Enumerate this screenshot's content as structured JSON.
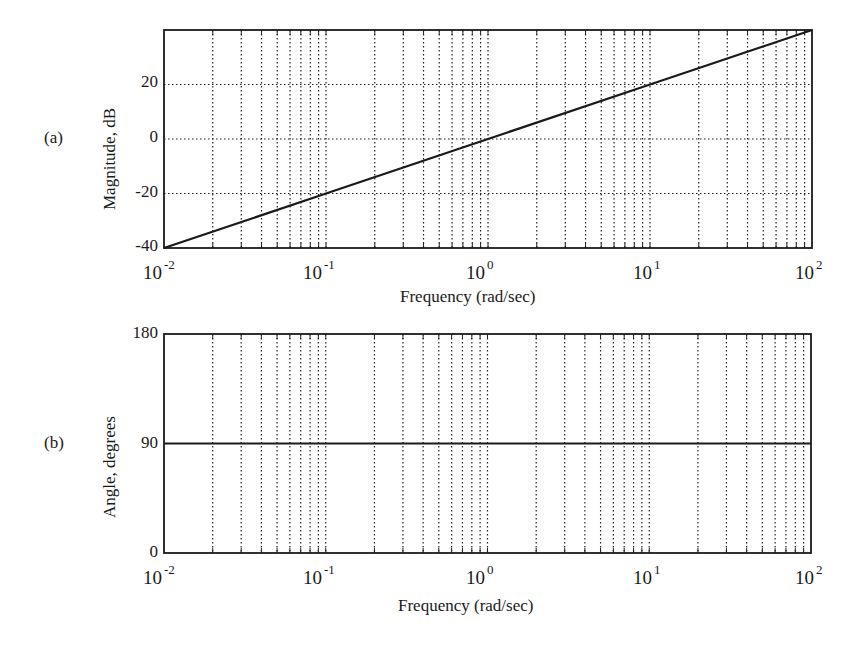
{
  "chart_data": [
    {
      "panel": "(a)",
      "type": "line",
      "title": "",
      "xlabel": "Frequency (rad/sec)",
      "ylabel": "Magnitude, dB",
      "xscale": "log",
      "xlim": [
        0.01,
        100
      ],
      "ylim": [
        -40,
        40
      ],
      "x_ticks": [
        "10^-2",
        "10^-1",
        "10^0",
        "10^1",
        "10^2"
      ],
      "y_ticks": [
        "-40",
        "-20",
        "0",
        "20"
      ],
      "grid": true,
      "series": [
        {
          "name": "magnitude",
          "x": [
            0.01,
            0.1,
            1,
            10,
            100
          ],
          "values": [
            -40,
            -20,
            0,
            20,
            40
          ]
        }
      ]
    },
    {
      "panel": "(b)",
      "type": "line",
      "title": "",
      "xlabel": "Frequency  (rad/sec)",
      "ylabel": "Angle, degrees",
      "xscale": "log",
      "xlim": [
        0.01,
        100
      ],
      "ylim": [
        0,
        180
      ],
      "x_ticks": [
        "10^-2",
        "10^-1",
        "10^0",
        "10^1",
        "10^2"
      ],
      "y_ticks": [
        "0",
        "90",
        "180"
      ],
      "grid": "vertical-only",
      "series": [
        {
          "name": "phase",
          "x": [
            0.01,
            0.1,
            1,
            10,
            100
          ],
          "values": [
            90,
            90,
            90,
            90,
            90
          ]
        }
      ]
    }
  ],
  "panels": {
    "a": {
      "label": "(a)",
      "ylabel": "Magnitude, dB",
      "xlabel": "Frequency (rad/sec)",
      "yticks": [
        "20",
        "0",
        "-20",
        "-40"
      ]
    },
    "b": {
      "label": "(b)",
      "ylabel": "Angle, degrees",
      "xlabel": "Frequency  (rad/sec)",
      "yticks": [
        "180",
        "90",
        "0"
      ]
    },
    "xticks": {
      "base": "10",
      "exps": [
        "-2",
        "-1",
        "0",
        "1",
        "2"
      ]
    }
  },
  "colors": {
    "line": "#1a1a1a",
    "grid": "#222222",
    "background": "#ffffff"
  }
}
